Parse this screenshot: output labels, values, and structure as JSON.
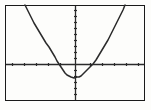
{
  "screen": {
    "label": "graphing-calculator-screen",
    "background_color": "#fdfdfb",
    "border_color": "#1a1a1a",
    "ink_color": "#2b2b2b",
    "frame": {
      "x": 5,
      "y": 5,
      "width": 140,
      "height": 96
    }
  },
  "chart_data": {
    "type": "line",
    "title": "",
    "subtitle": "",
    "xlabel": "",
    "ylabel": "",
    "grid": false,
    "legend": null,
    "axes": {
      "x_axis_pixel_y": 64,
      "y_axis_pixel_x": 75,
      "xlim": [
        -10,
        10
      ],
      "ylim": [
        -10,
        10
      ],
      "x_tick_interval": 2,
      "y_tick_interval": 1,
      "x_tick_pixels": [
        12,
        24,
        36,
        48,
        60,
        90,
        102,
        114,
        126,
        138
      ],
      "y_tick_pixels": [
        10,
        16,
        22,
        28,
        34,
        40,
        46,
        52,
        58,
        70,
        76,
        82,
        88,
        94
      ],
      "tick_length": 3,
      "tick_labels_visible": false
    },
    "series": [
      {
        "name": "parabola",
        "equation": "y = a(x - h)^2 + k",
        "vertex_pixel": [
          74,
          78
        ],
        "x_intercept_pixels": [
          57,
          93
        ],
        "y_intercept_pixel": 77,
        "opens": "up",
        "points_pixel": [
          [
            25,
            5
          ],
          [
            28,
            11
          ],
          [
            31,
            17
          ],
          [
            34,
            23
          ],
          [
            37,
            28
          ],
          [
            40,
            33
          ],
          [
            43,
            38
          ],
          [
            46,
            43
          ],
          [
            49,
            47
          ],
          [
            52,
            52
          ],
          [
            55,
            57
          ],
          [
            57,
            61
          ],
          [
            59,
            64
          ],
          [
            61,
            67
          ],
          [
            63,
            70
          ],
          [
            65,
            73
          ],
          [
            67,
            75
          ],
          [
            69,
            76
          ],
          [
            71,
            77
          ],
          [
            74,
            78
          ],
          [
            77,
            77
          ],
          [
            79,
            77
          ],
          [
            81,
            76
          ],
          [
            83,
            74
          ],
          [
            85,
            72
          ],
          [
            87,
            70
          ],
          [
            89,
            68
          ],
          [
            91,
            66
          ],
          [
            93,
            64
          ],
          [
            96,
            60
          ],
          [
            99,
            55
          ],
          [
            102,
            50
          ],
          [
            105,
            45
          ],
          [
            108,
            40
          ],
          [
            111,
            34
          ],
          [
            114,
            28
          ],
          [
            117,
            22
          ],
          [
            120,
            16
          ],
          [
            123,
            10
          ],
          [
            125,
            5
          ]
        ]
      }
    ]
  }
}
